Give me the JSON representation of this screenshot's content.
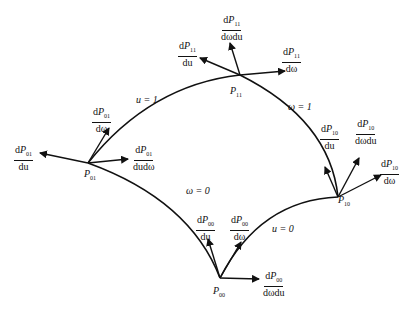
{
  "diagram": {
    "title": "",
    "curves": [
      {
        "id": "u1",
        "label": "u = 1"
      },
      {
        "id": "w1",
        "label": "ω = 1"
      },
      {
        "id": "w0",
        "label": "ω = 0"
      },
      {
        "id": "u0",
        "label": "u = 0"
      }
    ],
    "points": [
      {
        "id": "P11",
        "name": "P",
        "sub": "11"
      },
      {
        "id": "P01",
        "name": "P",
        "sub": "01"
      },
      {
        "id": "P10",
        "name": "P",
        "sub": "10"
      },
      {
        "id": "P00",
        "name": "P",
        "sub": "00"
      }
    ],
    "vectors": {
      "P11": [
        {
          "num": "dP",
          "sub": "11",
          "den": "du"
        },
        {
          "num": "dP",
          "sub": "11",
          "den": "dωdu"
        },
        {
          "num": "dP",
          "sub": "11",
          "den": "dω"
        }
      ],
      "P01": [
        {
          "num": "dP",
          "sub": "01",
          "den": "du"
        },
        {
          "num": "dP",
          "sub": "01",
          "den": "dω"
        },
        {
          "num": "dP",
          "sub": "01",
          "den": "dudω"
        }
      ],
      "P10": [
        {
          "num": "dP",
          "sub": "10",
          "den": "du"
        },
        {
          "num": "dP",
          "sub": "10",
          "den": "dωdu"
        },
        {
          "num": "dP",
          "sub": "10",
          "den": "dω"
        }
      ],
      "P00": [
        {
          "num": "dP",
          "sub": "00",
          "den": "du"
        },
        {
          "num": "dP",
          "sub": "00",
          "den": "dω"
        },
        {
          "num": "dP",
          "sub": "00",
          "den": "dωdu"
        }
      ]
    }
  }
}
